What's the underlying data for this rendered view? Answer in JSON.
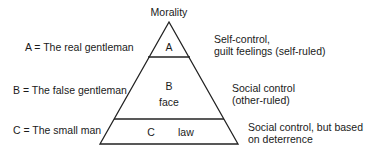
{
  "diagram": {
    "title": "Morality",
    "tiers": [
      {
        "letter": "A",
        "inner_text": "",
        "left_label": "A = The real gentleman",
        "right_label_lines": [
          "Self-control,",
          "guilt feelings (self-ruled)"
        ]
      },
      {
        "letter": "B",
        "inner_text": "face",
        "left_label": "B = The false gentleman",
        "right_label_lines": [
          "Social control",
          "(other-ruled)"
        ]
      },
      {
        "letter": "C",
        "inner_text": "law",
        "left_label": "C = The small man",
        "right_label_lines": [
          "Social control, but based",
          "on deterrence"
        ]
      }
    ],
    "line_color": "#222222"
  }
}
